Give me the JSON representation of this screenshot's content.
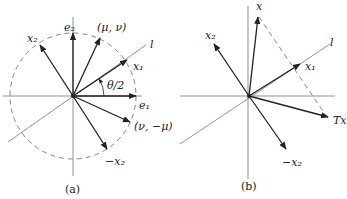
{
  "figure_a": {
    "caption": "(a)",
    "labels": {
      "e2": "e₂",
      "e1": "e₁",
      "x2": "x₂",
      "neg_x2": "−x₂",
      "x1": "x₁",
      "mu_nu": "(μ, ν)",
      "nu_neg_mu": "(ν, −μ)",
      "angle": "θ/2",
      "line": "l"
    }
  },
  "figure_b": {
    "caption": "(b)",
    "labels": {
      "x": "x",
      "x2": "x₂",
      "neg_x2": "−x₂",
      "x1": "x₁",
      "Tx": "Tx",
      "line": "l"
    }
  },
  "colors": {
    "ink": "#222222",
    "axis": "#777777",
    "background": "#ffffff"
  }
}
